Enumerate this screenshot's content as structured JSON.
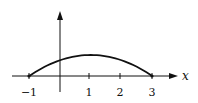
{
  "chart_data": {
    "type": "line",
    "title": "",
    "xlabel": "x",
    "ylabel": "",
    "x_ticks": [
      -1,
      1,
      2,
      3
    ],
    "x_tick_labels": [
      "−1",
      "1",
      "2",
      "3"
    ],
    "xlim": [
      -1,
      3
    ],
    "grid": false,
    "legend": null,
    "series": [
      {
        "name": "curve",
        "description": "concave-down arc (parabola) from (-1, 0) to (3, 0), maximum at x = 1",
        "x": [
          -1,
          -0.5,
          0,
          0.5,
          1,
          1.5,
          2,
          2.5,
          3
        ],
        "y": [
          0,
          0.4375,
          0.75,
          0.9375,
          1,
          0.9375,
          0.75,
          0.4375,
          0
        ]
      }
    ]
  },
  "labels": {
    "x_axis": "x",
    "ticks": [
      "−1",
      "1",
      "2",
      "3"
    ]
  },
  "colors": {
    "ink": "#111111",
    "background": "#ffffff"
  }
}
